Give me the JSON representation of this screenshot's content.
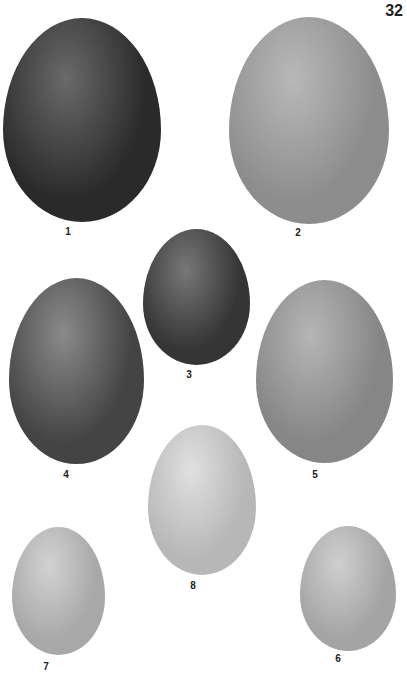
{
  "plate_number": "32",
  "eggs": [
    {
      "label": "1",
      "left": 3,
      "top": 18,
      "width": 158,
      "height": 204,
      "color": "#2a2a2a",
      "highlight": "#6a6a6a"
    },
    {
      "label": "2",
      "left": 229,
      "top": 17,
      "width": 160,
      "height": 207,
      "color": "#8d8d8d",
      "highlight": "#b8b8b8"
    },
    {
      "label": "3",
      "left": 143,
      "top": 229,
      "width": 107,
      "height": 136,
      "color": "#353535",
      "highlight": "#777777"
    },
    {
      "label": "4",
      "left": 9,
      "top": 278,
      "width": 135,
      "height": 186,
      "color": "#444444",
      "highlight": "#8a8a8a"
    },
    {
      "label": "5",
      "left": 256,
      "top": 280,
      "width": 137,
      "height": 183,
      "color": "#868686",
      "highlight": "#b5b5b5"
    },
    {
      "label": "8",
      "left": 148,
      "top": 425,
      "width": 108,
      "height": 150,
      "color": "#b7b7b7",
      "highlight": "#e0e0e0"
    },
    {
      "label": "7",
      "left": 12,
      "top": 527,
      "width": 93,
      "height": 128,
      "color": "#a8a8a8",
      "highlight": "#d2d2d2"
    },
    {
      "label": "6",
      "left": 300,
      "top": 526,
      "width": 96,
      "height": 125,
      "color": "#a4a4a4",
      "highlight": "#cfcfcf"
    }
  ],
  "labels": [
    {
      "text": "1",
      "x": 68,
      "y": 226
    },
    {
      "text": "2",
      "x": 298,
      "y": 227
    },
    {
      "text": "3",
      "x": 189,
      "y": 369
    },
    {
      "text": "4",
      "x": 66,
      "y": 469
    },
    {
      "text": "5",
      "x": 315,
      "y": 469
    },
    {
      "text": "8",
      "x": 193,
      "y": 580
    },
    {
      "text": "7",
      "x": 46,
      "y": 661
    },
    {
      "text": "6",
      "x": 338,
      "y": 653
    }
  ]
}
